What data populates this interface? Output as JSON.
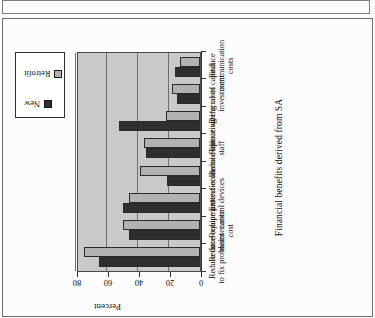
{
  "figure": {
    "title": "Financial benefits derived from SA",
    "value_axis_title": "Percent"
  },
  "legend": {
    "items": [
      {
        "label": "New",
        "color": "#2f2f2f"
      },
      {
        "label": "Retrofit",
        "color": "#b2b2b2"
      }
    ]
  },
  "axis": {
    "ticks": [
      "0",
      "20",
      "40",
      "60",
      "80"
    ]
  },
  "chart_data": {
    "type": "bar",
    "title": "Financial benefits derived from SA",
    "xlabel": "",
    "ylabel": "Percent",
    "ylim": [
      0,
      80
    ],
    "yticks": [
      0,
      20,
      40,
      60,
      80
    ],
    "grid": true,
    "orientation": "rotated-90-ccw",
    "legend_position": "top-center",
    "categories": [
      "Reduce time\nto fix problems",
      "Reduce equipment\nmaintenance\ncost",
      "Reduce protection &\ncontrol devices",
      "Extend economic life",
      "Reduce operating\nstaff",
      "Reduce wiring costs",
      "Deferral of capital\ninvestment",
      "Reduce communication\ncosts"
    ],
    "series": [
      {
        "name": "New",
        "color": "#2f2f2f",
        "values": [
          65,
          46,
          50,
          21,
          35,
          52,
          15,
          16
        ]
      },
      {
        "name": "Retrofit",
        "color": "#b2b2b2",
        "values": [
          75,
          50,
          46,
          39,
          36,
          22,
          18,
          13
        ]
      }
    ]
  }
}
